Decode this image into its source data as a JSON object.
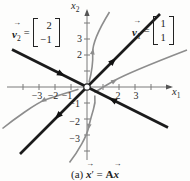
{
  "figure": {
    "type": "phase-portrait-saddle",
    "origin_marker": "open-circle"
  },
  "colors": {
    "background": "#fdfdfc",
    "eigenline": "#1b1b1b",
    "trajectory": "#8d8d8d",
    "axis": "#7a7a7a",
    "text": "#222222"
  },
  "icons": {
    "vector_arrow": "→"
  },
  "axes": {
    "x": {
      "base": "x",
      "sub": "1"
    },
    "y": {
      "base": "x",
      "sub": "2"
    },
    "x_ticks": [
      "−3",
      "−2",
      "−1",
      "2",
      "3"
    ],
    "y_ticks": [
      "3",
      "2",
      "−1",
      "−2",
      "−3"
    ]
  },
  "eigenvectors": [
    {
      "symbol": "v",
      "sub": "1",
      "equals": "=",
      "entries": [
        "1",
        "1"
      ],
      "flow": "outward"
    },
    {
      "symbol": "v",
      "sub": "2",
      "equals": "=",
      "entries": [
        "2",
        "−1"
      ],
      "flow": "inward"
    }
  ],
  "caption": {
    "index": "(a)",
    "x": "x",
    "prime": "′",
    "equals": "=",
    "A": "A"
  }
}
